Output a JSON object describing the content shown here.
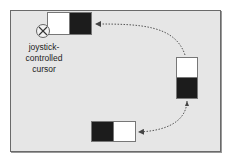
{
  "diagram": {
    "cursor_label_lines": [
      "joystick-",
      "controlled",
      "cursor"
    ],
    "cursor_icon": "circle-x-icon",
    "colors": {
      "background": "#e6e6e6",
      "dark_cell": "#1c1c1c",
      "light_cell": "#ffffff",
      "arrow": "#555555"
    },
    "blocks": [
      {
        "id": "top-left",
        "orientation": "horizontal",
        "cells": [
          "white",
          "black"
        ]
      },
      {
        "id": "right",
        "orientation": "vertical",
        "cells": [
          "white",
          "black"
        ]
      },
      {
        "id": "bottom",
        "orientation": "horizontal",
        "cells": [
          "black",
          "white"
        ]
      }
    ],
    "arrows": [
      {
        "from": "right",
        "to": "top-left",
        "style": "dotted"
      },
      {
        "from": "right",
        "to": "bottom",
        "style": "dotted"
      }
    ]
  }
}
